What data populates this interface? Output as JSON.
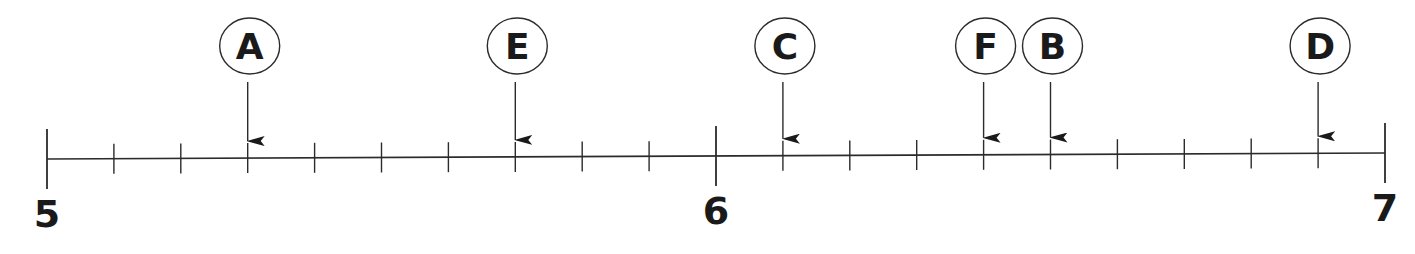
{
  "diagram": {
    "type": "number-line",
    "range": {
      "start": 5,
      "end": 7
    },
    "step": 0.1,
    "major_labels": [
      {
        "value": 5,
        "label": "5"
      },
      {
        "value": 6,
        "label": "6"
      },
      {
        "value": 7,
        "label": "7"
      }
    ],
    "markers": [
      {
        "label": "A",
        "value": 5.3
      },
      {
        "label": "E",
        "value": 5.7
      },
      {
        "label": "C",
        "value": 6.1
      },
      {
        "label": "F",
        "value": 6.4
      },
      {
        "label": "B",
        "value": 6.5
      },
      {
        "label": "D",
        "value": 6.9
      }
    ],
    "colors": {
      "line": "#2b2b2b",
      "text": "#1a1a1a",
      "background": "#ffffff"
    }
  }
}
